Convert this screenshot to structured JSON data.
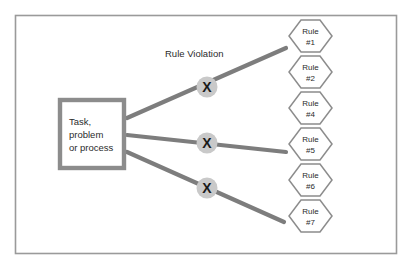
{
  "diagram": {
    "title_label": "Rule Violation",
    "source_box": {
      "lines": [
        "Task,",
        "problem",
        "or process"
      ]
    },
    "markers": [
      {
        "glyph": "X",
        "name": "rule-violation-marker-1"
      },
      {
        "glyph": "X",
        "name": "rule-violation-marker-2"
      },
      {
        "glyph": "X",
        "name": "rule-violation-marker-3"
      }
    ],
    "rules": [
      {
        "line1": "Rule",
        "line2": "#1"
      },
      {
        "line1": "Rule",
        "line2": "#2"
      },
      {
        "line1": "Rule",
        "line2": "#4"
      },
      {
        "line1": "Rule",
        "line2": "#5"
      },
      {
        "line1": "Rule",
        "line2": "#6"
      },
      {
        "line1": "Rule",
        "line2": "#7"
      }
    ],
    "colors": {
      "background": "#ffffff",
      "frame_stroke": "#9a9a9a",
      "line_stroke": "#7d7d7d",
      "box_stroke": "#8c8c8c",
      "hex_stroke": "#8c8c8c",
      "marker_fill": "#c9c9c9",
      "text": "#2b2b2b"
    }
  }
}
